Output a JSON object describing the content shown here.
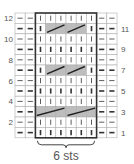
{
  "chart": {
    "columns": 10,
    "rows": 12,
    "repeat_label": "6 sts",
    "repeat_columns": [
      3,
      8
    ],
    "left_row_numbers": [
      "12",
      "10",
      "8",
      "6",
      "4",
      "2"
    ],
    "right_row_numbers": [
      "11",
      "9",
      "7",
      "5",
      "3",
      "1"
    ],
    "colors": {
      "grid": "#b0b0b0",
      "repeat_border": "#333333",
      "cable_fill": "#bdbdbd",
      "cable_line": "#222222",
      "symbol": "#333333"
    },
    "legend": {
      "dash": "purl",
      "bar": "knit",
      "cable": "cable cross (3-st or 2-st)"
    },
    "grid_rows": [
      {
        "row": 12,
        "cells": [
          "P",
          "P",
          "K",
          "K",
          "K",
          "K",
          "K",
          "K",
          "P",
          "P"
        ]
      },
      {
        "row": 11,
        "cells": [
          "P",
          "P",
          "K",
          "C2a",
          "C2b",
          "C2a",
          "C2b",
          "K",
          "P",
          "P"
        ]
      },
      {
        "row": 10,
        "cells": [
          "P",
          "P",
          "K",
          "K",
          "K",
          "K",
          "K",
          "K",
          "P",
          "P"
        ]
      },
      {
        "row": 9,
        "cells": [
          "P",
          "P",
          "K",
          "K",
          "K",
          "K",
          "K",
          "K",
          "P",
          "P"
        ]
      },
      {
        "row": 8,
        "cells": [
          "P",
          "P",
          "K",
          "K",
          "K",
          "K",
          "K",
          "K",
          "P",
          "P"
        ]
      },
      {
        "row": 7,
        "cells": [
          "P",
          "P",
          "K",
          "C2a",
          "C2b",
          "C2a",
          "C2b",
          "K",
          "P",
          "P"
        ]
      },
      {
        "row": 6,
        "cells": [
          "P",
          "P",
          "K",
          "K",
          "K",
          "K",
          "K",
          "K",
          "P",
          "P"
        ]
      },
      {
        "row": 5,
        "cells": [
          "P",
          "P",
          "K",
          "K",
          "K",
          "K",
          "K",
          "K",
          "P",
          "P"
        ]
      },
      {
        "row": 4,
        "cells": [
          "P",
          "P",
          "K",
          "K",
          "K",
          "K",
          "K",
          "K",
          "P",
          "P"
        ]
      },
      {
        "row": 3,
        "cells": [
          "P",
          "P",
          "C3a",
          "C3b",
          "C3c",
          "C3a",
          "C3b",
          "C3c",
          "P",
          "P"
        ]
      },
      {
        "row": 2,
        "cells": [
          "P",
          "P",
          "K",
          "K",
          "K",
          "K",
          "K",
          "K",
          "P",
          "P"
        ]
      },
      {
        "row": 1,
        "cells": [
          "P",
          "P",
          "K",
          "K",
          "K",
          "K",
          "K",
          "K",
          "P",
          "P"
        ]
      }
    ]
  }
}
